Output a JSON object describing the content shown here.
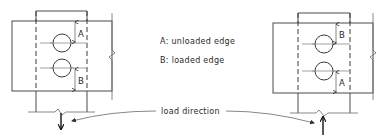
{
  "legend": {
    "a_label": "A: unloaded edge",
    "b_label": "B: loaded edge"
  },
  "load_direction_label": "load direction",
  "left_joint": {
    "top_dimension_label": "A",
    "bottom_dimension_label": "B",
    "load_arrow": "down"
  },
  "right_joint": {
    "top_dimension_label": "B",
    "bottom_dimension_label": "A",
    "load_arrow": "up"
  },
  "colors": {
    "line": "#4a4a4a",
    "text": "#2a2a2a",
    "background": "#ffffff"
  }
}
